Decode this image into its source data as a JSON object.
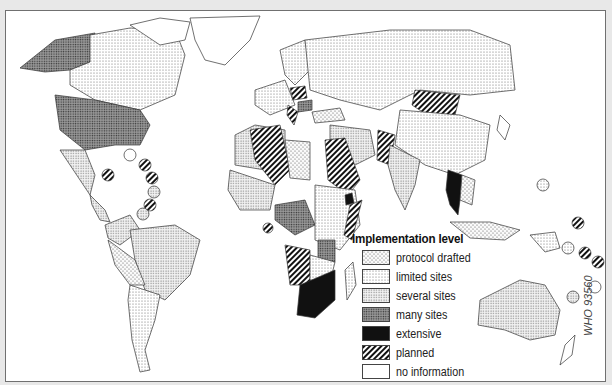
{
  "legend": {
    "title": "Implementation level",
    "items": [
      {
        "label": "protocol drafted",
        "pattern": "crosshatch-fine"
      },
      {
        "label": "limited sites",
        "pattern": "dots-light"
      },
      {
        "label": "several sites",
        "pattern": "dots-medium"
      },
      {
        "label": "many sites",
        "pattern": "dots-dense"
      },
      {
        "label": "extensive",
        "pattern": "solid-black"
      },
      {
        "label": "planned",
        "pattern": "diagonal-stripes"
      },
      {
        "label": "no information",
        "pattern": "white"
      }
    ]
  },
  "map": {
    "regions": [
      {
        "name": "Alaska",
        "level": "many sites"
      },
      {
        "name": "Canada",
        "level": "limited sites"
      },
      {
        "name": "United States",
        "level": "many sites"
      },
      {
        "name": "Mexico",
        "level": "several sites"
      },
      {
        "name": "Central America",
        "level": "several sites"
      },
      {
        "name": "Caribbean islands",
        "level": "planned"
      },
      {
        "name": "Brazil",
        "level": "several sites"
      },
      {
        "name": "Bolivia/Peru",
        "level": "protocol drafted"
      },
      {
        "name": "Argentina",
        "level": "limited sites"
      },
      {
        "name": "Greenland",
        "level": "no information"
      },
      {
        "name": "Russia",
        "level": "limited sites"
      },
      {
        "name": "Mongolia",
        "level": "planned"
      },
      {
        "name": "China",
        "level": "limited sites"
      },
      {
        "name": "India",
        "level": "several sites"
      },
      {
        "name": "Thailand",
        "level": "extensive"
      },
      {
        "name": "Pakistan",
        "level": "planned"
      },
      {
        "name": "Algeria",
        "level": "planned"
      },
      {
        "name": "Libya",
        "level": "protocol drafted"
      },
      {
        "name": "Egypt/Sudan",
        "level": "planned"
      },
      {
        "name": "Ethiopia region",
        "level": "extensive"
      },
      {
        "name": "Namibia/Angola",
        "level": "planned"
      },
      {
        "name": "South Africa",
        "level": "extensive"
      },
      {
        "name": "Central Africa",
        "level": "many sites"
      },
      {
        "name": "Australia",
        "level": "several sites"
      },
      {
        "name": "Pacific islands",
        "level": "planned"
      }
    ]
  },
  "code": "WHO 93560"
}
